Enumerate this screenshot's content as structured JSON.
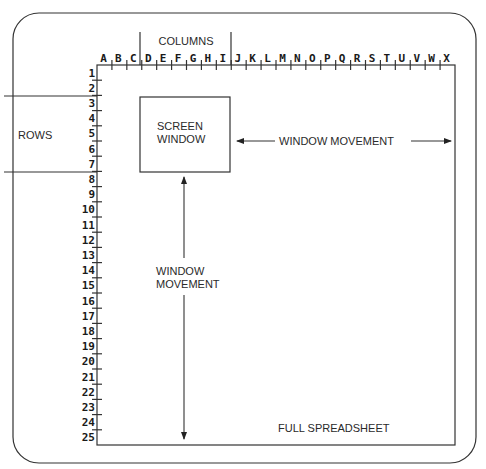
{
  "diagram": {
    "labels": {
      "columns": "COLUMNS",
      "rows": "ROWS",
      "screen_window_line1": "SCREEN",
      "screen_window_line2": "WINDOW",
      "horizontal_movement": "WINDOW MOVEMENT",
      "vertical_movement_line1": "WINDOW",
      "vertical_movement_line2": "MOVEMENT",
      "full_spreadsheet": "FULL SPREADSHEET"
    },
    "column_headers": [
      "A",
      "B",
      "C",
      "D",
      "E",
      "F",
      "G",
      "H",
      "I",
      "J",
      "K",
      "L",
      "M",
      "N",
      "O",
      "P",
      "Q",
      "R",
      "S",
      "T",
      "U",
      "V",
      "W",
      "X"
    ],
    "row_headers": [
      "1",
      "2",
      "3",
      "4",
      "5",
      "6",
      "7",
      "8",
      "9",
      "10",
      "11",
      "12",
      "13",
      "14",
      "15",
      "16",
      "17",
      "18",
      "19",
      "20",
      "21",
      "22",
      "23",
      "24",
      "25"
    ],
    "screen_window": {
      "columns_spanned": [
        "D",
        "E",
        "F",
        "G",
        "H",
        "I"
      ],
      "rows_spanned": [
        "3",
        "4",
        "5",
        "6",
        "7"
      ]
    },
    "colors": {
      "line": "#333333",
      "text": "#2a2a2a",
      "background": "#ffffff"
    }
  }
}
